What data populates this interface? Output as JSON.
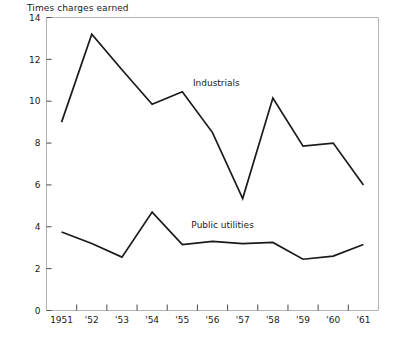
{
  "chart_data": {
    "type": "line",
    "title": "Times charges earned",
    "xlabel": "",
    "ylabel": "",
    "ylim": [
      0,
      14
    ],
    "yticks": [
      0,
      2,
      4,
      6,
      8,
      10,
      12,
      14
    ],
    "ytick_labels": [
      "0",
      "2",
      "4",
      "6",
      "8",
      "10",
      "12",
      "14"
    ],
    "categories": [
      "1951",
      "'52",
      "'53",
      "'54",
      "'55",
      "'56",
      "'57",
      "'58",
      "'59",
      "'60",
      "'61"
    ],
    "x": [
      1951,
      1952,
      1953,
      1954,
      1955,
      1956,
      1957,
      1958,
      1959,
      1960,
      1961
    ],
    "grid": false,
    "legend_position": "inline-annotation",
    "series": [
      {
        "name": "Industrials",
        "values": [
          9.0,
          13.2,
          11.5,
          9.85,
          10.45,
          8.5,
          5.35,
          10.15,
          7.85,
          8.0,
          6.0
        ],
        "label_x": 1955.35,
        "label_y": 10.75
      },
      {
        "name": "Public utilities",
        "values": [
          3.75,
          3.2,
          2.55,
          4.7,
          3.15,
          3.3,
          3.2,
          3.25,
          2.45,
          2.6,
          3.15
        ],
        "label_x": 1955.3,
        "label_y": 3.95
      }
    ]
  }
}
